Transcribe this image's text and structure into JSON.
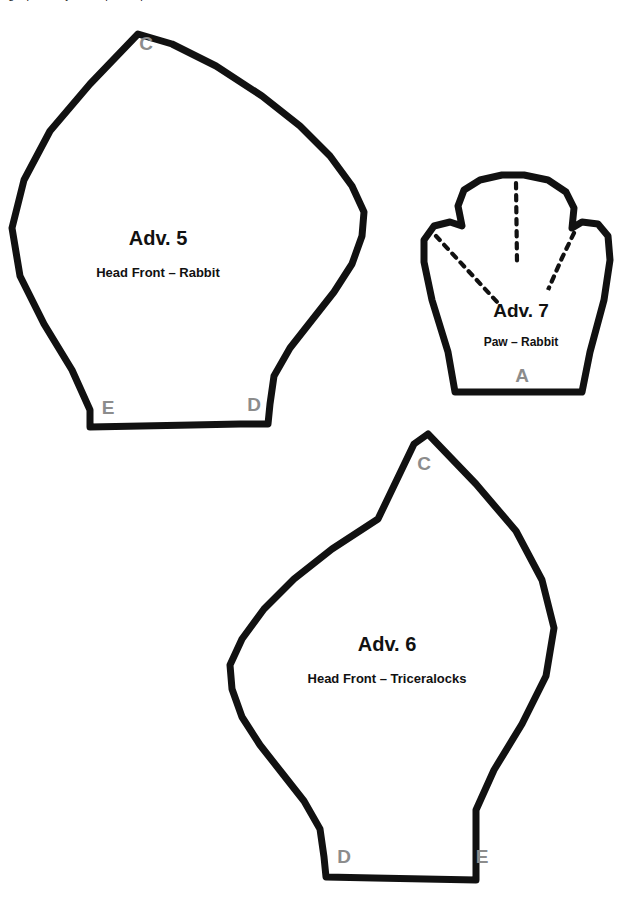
{
  "document": {
    "type": "sewing-pattern-sheet",
    "background_color": "#ffffff",
    "outline_color": "#111111",
    "notch_label_color": "#8c8c8c",
    "clipped_header_text": "ng it precisely to the part of parts"
  },
  "pieces": [
    {
      "id": "adv-5",
      "title": "Adv. 5",
      "subtitle": "Head Front – Rabbit",
      "title_x": 158,
      "title_y": 245,
      "subtitle_x": 158,
      "subtitle_y": 277,
      "title_size": 20,
      "subtitle_size": 13,
      "outline_stroke_width": 7,
      "path": "M 138 34 L 90 84 L 50 131 L 24 180 L 12 228 L 20 276 L 44 324 L 72 370 L 90 410 L 90 427 L 192 425 L 240 424 L 268 424 L 270 404 L 274 376 L 290 348 L 312 320 L 334 292 L 352 264 L 362 236 L 364 212 L 352 186 L 330 156 L 300 126 L 262 96 L 216 66 L 172 44 Z",
      "labels": [
        {
          "text": "C",
          "x": 146,
          "y": 50,
          "size": 19
        },
        {
          "text": "E",
          "x": 108,
          "y": 414,
          "size": 19
        },
        {
          "text": "D",
          "x": 254,
          "y": 411,
          "size": 19
        }
      ]
    },
    {
      "id": "adv-6",
      "title": "Adv. 6",
      "subtitle": "Head Front – Triceralocks",
      "title_x": 387,
      "title_y": 651,
      "subtitle_x": 387,
      "subtitle_y": 683,
      "title_size": 20,
      "subtitle_size": 13,
      "outline_stroke_width": 7,
      "path": "M 428 434 L 476 484 L 516 531 L 542 580 L 554 628 L 546 676 L 522 724 L 494 770 L 476 810 L 476 880 L 374 878 L 326 877 L 326 877 L 324 857 L 320 829 L 304 801 L 282 773 L 260 745 L 242 717 L 232 689 L 230 665 L 242 639 L 264 609 L 294 579 L 332 549 L 378 519 L 414 444 Z",
      "labels": [
        {
          "text": "C",
          "x": 424,
          "y": 470,
          "size": 19
        },
        {
          "text": "D",
          "x": 344,
          "y": 863,
          "size": 19
        },
        {
          "text": "E",
          "x": 482,
          "y": 863,
          "size": 19
        }
      ]
    },
    {
      "id": "adv-7",
      "title": "Adv. 7",
      "subtitle": "Paw – Rabbit",
      "title_x": 521,
      "title_y": 317,
      "subtitle_x": 521,
      "subtitle_y": 346,
      "title_size": 19,
      "subtitle_size": 12,
      "outline_stroke_width": 7,
      "path": "M 455 392 L 448 352 L 432 300 L 424 262 L 424 240 L 434 226 L 450 222 L 462 226 L 458 206 L 464 190 L 480 180 L 502 175 L 524 175 L 548 180 L 566 192 L 574 208 L 572 228 L 582 222 L 598 224 L 608 236 L 610 260 L 604 300 L 590 352 L 582 392 Z",
      "bottom_bar": {
        "x1": 452,
        "y1": 390,
        "x2": 584,
        "y2": 390
      },
      "seams": [
        {
          "id": "toe-seam-center",
          "d": "M 516 183 L 517 262"
        },
        {
          "id": "toe-seam-left",
          "d": "M 436 236 L 498 303"
        },
        {
          "id": "toe-seam-right",
          "d": "M 574 233 L 562 258 L 548 290 L 562 258"
        }
      ],
      "labels": [
        {
          "text": "A",
          "x": 522,
          "y": 382,
          "size": 19
        }
      ]
    }
  ]
}
